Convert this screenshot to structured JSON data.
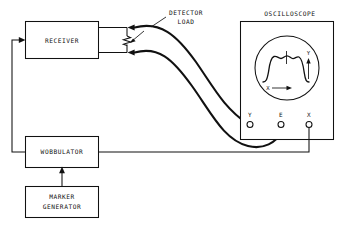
{
  "diagram": {
    "blocks": [
      {
        "id": "receiver",
        "label": "RECEIVER"
      },
      {
        "id": "wobbulator",
        "label": "WOBBULATOR"
      },
      {
        "id": "marker_generator",
        "label_line1": "MARKER",
        "label_line2": "GENERATOR"
      },
      {
        "id": "oscilloscope",
        "label": "OSCILLOSCOPE"
      }
    ],
    "callout": {
      "line1": "DETECTOR",
      "line2": "LOAD"
    },
    "oscilloscope": {
      "title": "OSCILLOSCOPE",
      "terminals": [
        {
          "id": "y",
          "label": "Y"
        },
        {
          "id": "e",
          "label": "E"
        },
        {
          "id": "x",
          "label": "X"
        }
      ],
      "screen_axes": {
        "x_label": "X",
        "y_label": "Y"
      }
    },
    "components": {
      "detector_load": "resistor"
    }
  },
  "colors": {
    "ink": "#111111",
    "paper": "#ffffff"
  }
}
